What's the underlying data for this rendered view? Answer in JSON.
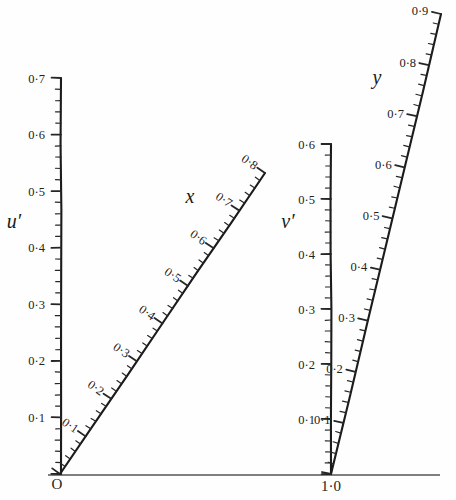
{
  "figure": {
    "type": "nomogram",
    "background_color": "#fefefe",
    "ink_color": "#1b1b1b",
    "baseline_color": "#555555",
    "width": 456,
    "height": 500
  },
  "baseline": {
    "name": "horizontal-baseline",
    "x1": 48,
    "y1": 475,
    "x2": 440,
    "y2": 475
  },
  "origin_markers": [
    {
      "label": "O",
      "x": 57,
      "y": 489,
      "size": 15
    },
    {
      "label": "1·0",
      "x": 331,
      "y": 491,
      "size": 15
    }
  ],
  "chart_data": {
    "type": "line",
    "title": "",
    "xlabel": "",
    "ylabel": "",
    "grid": false,
    "legend": null,
    "scales": [
      {
        "name": "u-prime-scale",
        "label": "u′",
        "label_x": 14,
        "label_y": 228,
        "orientation": "vertical",
        "x1": 61,
        "y1": 474,
        "x2": 61,
        "y2": 78,
        "tick_side": "left",
        "range": [
          0.0,
          0.7
        ],
        "major_step": 0.1,
        "minor_step": 0.02,
        "major_ticks": [
          {
            "value": 0.7,
            "text": "0·7"
          },
          {
            "value": 0.6,
            "text": "0·6"
          },
          {
            "value": 0.5,
            "text": "0·5"
          },
          {
            "value": 0.4,
            "text": "0·4"
          },
          {
            "value": 0.3,
            "text": "0·3"
          },
          {
            "value": 0.2,
            "text": "0·2"
          },
          {
            "value": 0.1,
            "text": "0·1"
          }
        ]
      },
      {
        "name": "x-scale",
        "label": "x",
        "label_x": 190,
        "label_y": 203,
        "orientation": "diagonal",
        "x1": 60,
        "y1": 474,
        "x2": 265,
        "y2": 173,
        "tick_side": "left",
        "range": [
          0.0,
          0.8
        ],
        "major_step": 0.1,
        "minor_step": 0.02,
        "major_ticks": [
          {
            "value": 0.1,
            "text": "0·1"
          },
          {
            "value": 0.2,
            "text": "0·2"
          },
          {
            "value": 0.3,
            "text": "0·3"
          },
          {
            "value": 0.4,
            "text": "0·4"
          },
          {
            "value": 0.5,
            "text": "0·5"
          },
          {
            "value": 0.6,
            "text": "0·6"
          },
          {
            "value": 0.7,
            "text": "0·7"
          },
          {
            "value": 0.8,
            "text": "0·8"
          }
        ]
      },
      {
        "name": "v-prime-scale",
        "label": "v′",
        "label_x": 288,
        "label_y": 228,
        "orientation": "vertical",
        "x1": 331,
        "y1": 474,
        "x2": 331,
        "y2": 144,
        "tick_side": "left",
        "range": [
          0.0,
          0.6
        ],
        "major_step": 0.1,
        "minor_step": 0.02,
        "major_ticks": [
          {
            "value": 0.6,
            "text": "0·6"
          },
          {
            "value": 0.5,
            "text": "0·5"
          },
          {
            "value": 0.4,
            "text": "0·4"
          },
          {
            "value": 0.3,
            "text": "0·3"
          },
          {
            "value": 0.2,
            "text": "0·2"
          },
          {
            "value": 0.1,
            "text": "0·1"
          }
        ]
      },
      {
        "name": "y-scale",
        "label": "y",
        "label_x": 377,
        "label_y": 84,
        "orientation": "diagonal-steep",
        "x1": 331,
        "y1": 474,
        "x2": 441,
        "y2": 14,
        "tick_side": "left",
        "range": [
          0.0,
          0.9
        ],
        "major_step": 0.1,
        "minor_step": 0.02,
        "major_ticks": [
          {
            "value": 0.1,
            "text": "0·1"
          },
          {
            "value": 0.2,
            "text": "0·2"
          },
          {
            "value": 0.3,
            "text": "0·3"
          },
          {
            "value": 0.4,
            "text": "0·4"
          },
          {
            "value": 0.5,
            "text": "0·5"
          },
          {
            "value": 0.6,
            "text": "0·6"
          },
          {
            "value": 0.7,
            "text": "0·7"
          },
          {
            "value": 0.8,
            "text": "0·8"
          },
          {
            "value": 0.9,
            "text": "0·9"
          }
        ]
      }
    ]
  }
}
